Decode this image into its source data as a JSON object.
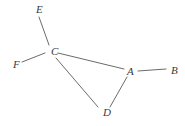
{
  "diagram": {
    "type": "graph",
    "nodes": [
      {
        "id": "E",
        "label": "E",
        "x": 36,
        "y": 13
      },
      {
        "id": "C",
        "label": "C",
        "x": 51,
        "y": 55
      },
      {
        "id": "F",
        "label": "F",
        "x": 13,
        "y": 68
      },
      {
        "id": "A",
        "label": "A",
        "x": 127,
        "y": 75
      },
      {
        "id": "B",
        "label": "B",
        "x": 171,
        "y": 74
      },
      {
        "id": "D",
        "label": "D",
        "x": 103,
        "y": 116
      }
    ],
    "edges": [
      {
        "from": "E",
        "to": "C",
        "x1": 39,
        "y1": 17,
        "x2": 49,
        "y2": 45
      },
      {
        "from": "F",
        "to": "C",
        "x1": 22,
        "y1": 62,
        "x2": 45,
        "y2": 53
      },
      {
        "from": "C",
        "to": "A",
        "x1": 58,
        "y1": 53,
        "x2": 124,
        "y2": 69
      },
      {
        "from": "C",
        "to": "D",
        "x1": 56,
        "y1": 58,
        "x2": 98,
        "y2": 107
      },
      {
        "from": "A",
        "to": "D",
        "x1": 127,
        "y1": 77,
        "x2": 110,
        "y2": 107
      },
      {
        "from": "A",
        "to": "B",
        "x1": 138,
        "y1": 71,
        "x2": 166,
        "y2": 69
      }
    ],
    "colors": {
      "line": "#5a5a5a",
      "label": "#3a3a3a",
      "background": "#ffffff"
    }
  }
}
